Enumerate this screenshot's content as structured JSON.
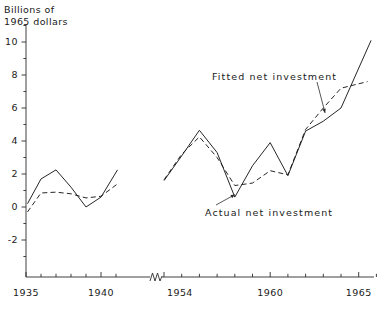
{
  "chart_data": {
    "type": "line",
    "title": "",
    "ylabel": "Billions of\n1965 dollars",
    "xlabel": "",
    "ylim": [
      -3.2,
      11.2
    ],
    "yticks": [
      -2,
      0,
      2,
      4,
      6,
      8,
      10
    ],
    "ytick_labels": [
      "-2",
      "0",
      "2",
      "4",
      "6",
      "8",
      "10"
    ],
    "yminor": [
      -3,
      -1,
      1,
      3,
      5,
      7,
      9,
      11
    ],
    "grid": false,
    "legend_position": "annotations-inline",
    "axis_break": true,
    "panels": [
      {
        "name": "prewar",
        "xlim": [
          1934.7,
          1941.6
        ],
        "xticks": [
          1935,
          1936,
          1937,
          1938,
          1939,
          1940,
          1941
        ],
        "xtick_labels": [
          "1935",
          "",
          "",
          "",
          "",
          "1940",
          ""
        ]
      },
      {
        "name": "postwar",
        "xlim": [
          1953.7,
          1966.0
        ],
        "xticks": [
          1954,
          1955,
          1956,
          1957,
          1958,
          1959,
          1960,
          1961,
          1962,
          1963,
          1964,
          1965,
          1966
        ],
        "xtick_labels": [
          "1954",
          "",
          "",
          "",
          "",
          "",
          "1960",
          "",
          "",
          "",
          "",
          "1965",
          ""
        ]
      }
    ],
    "series": [
      {
        "name": "Actual net investment",
        "style": "solid",
        "segments": [
          {
            "x": [
              1935.1,
              1936.0,
              1937.0,
              1938.0,
              1939.0,
              1940.0,
              1941.1
            ],
            "values": [
              0.2,
              1.7,
              2.25,
              1.2,
              0.0,
              0.6,
              2.25
            ]
          },
          {
            "x": [
              1954.0,
              1955.0,
              1956.0,
              1957.0,
              1958.0,
              1959.0,
              1960.0,
              1961.0,
              1962.0,
              1963.0,
              1964.0,
              1965.7
            ],
            "values": [
              1.6,
              3.1,
              4.65,
              3.3,
              0.6,
              2.5,
              3.9,
              1.9,
              4.6,
              5.2,
              6.0,
              10.1
            ]
          }
        ]
      },
      {
        "name": "Fitted net investment",
        "style": "dashed",
        "segments": [
          {
            "x": [
              1935.1,
              1936.0,
              1937.0,
              1938.0,
              1939.0,
              1940.0,
              1941.1
            ],
            "values": [
              -0.3,
              0.85,
              0.9,
              0.8,
              0.55,
              0.65,
              1.4
            ]
          },
          {
            "x": [
              1954.0,
              1955.0,
              1956.0,
              1957.0,
              1958.0,
              1959.0,
              1960.0,
              1961.0,
              1962.0,
              1963.0,
              1964.0,
              1965.5
            ],
            "values": [
              1.65,
              3.2,
              4.25,
              3.0,
              1.3,
              1.45,
              2.2,
              1.95,
              4.7,
              6.0,
              7.2,
              7.6
            ]
          }
        ]
      }
    ],
    "annotations": [
      {
        "label": "Fitted net investment",
        "target_x": 1963.1,
        "target_y": 5.7
      },
      {
        "label": "Actual net investment",
        "target_x": 1958.0,
        "target_y": 0.75
      }
    ]
  }
}
